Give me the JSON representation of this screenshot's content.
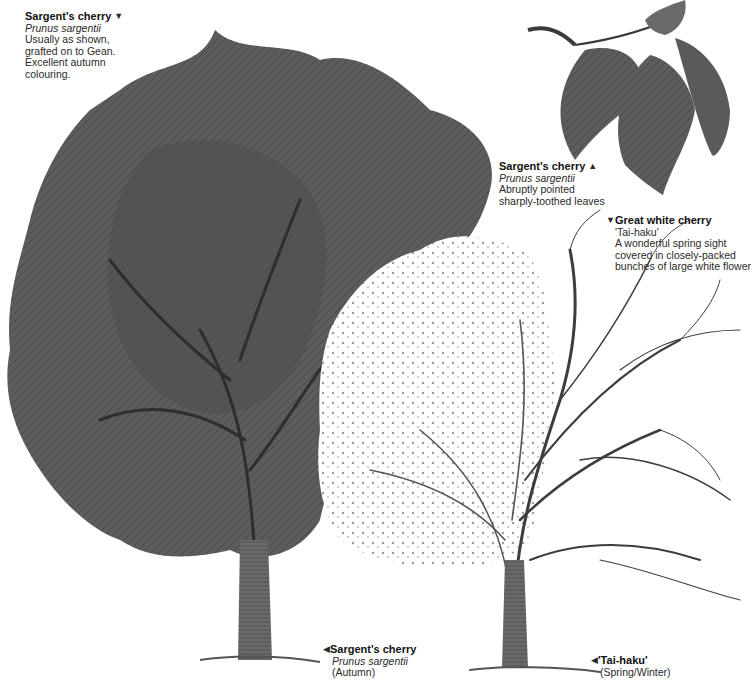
{
  "illustration": {
    "subject": "Cherry trees botanical plate",
    "palette": {
      "foliage": "#5a5a5a",
      "foliage_dark": "#3d3d3d",
      "blossom": "#ffffff",
      "bark": "#4a4a4a",
      "background": "#ffffff"
    }
  },
  "labels": [
    {
      "id": "sargent-tree",
      "title": "Sargent's cherry",
      "arrow": "▼",
      "latin": "Prunus sargentii",
      "lines": [
        "Usually as shown,",
        "grafted on to Gean.",
        "Excellent autumn",
        "colouring."
      ]
    },
    {
      "id": "sargent-leaves",
      "title": "Sargent's cherry",
      "arrow": "▲",
      "latin": "Prunus sargentii",
      "lines": [
        "Abruptly pointed",
        "sharply-toothed leaves"
      ]
    },
    {
      "id": "great-white",
      "title": "Great white cherry",
      "arrow": "▼",
      "subtitle": "'Tai-haku'",
      "lines": [
        "A wonderful spring sight",
        "covered in closely-packed",
        "bunches of large white flower"
      ]
    },
    {
      "id": "sargent-autumn",
      "title": "Sargent's cherry",
      "arrow": "◀",
      "latin": "Prunus sargentii",
      "lines": [
        "(Autumn)"
      ]
    },
    {
      "id": "tai-haku",
      "title": "'Tai-haku'",
      "arrow": "◀",
      "lines": [
        "(Spring/Winter)"
      ]
    }
  ]
}
